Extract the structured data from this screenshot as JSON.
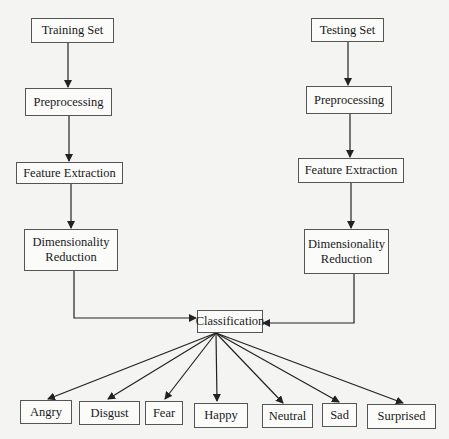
{
  "diagram": {
    "left_branch": {
      "training_set": "Training Set",
      "preprocessing": "Preprocessing",
      "feature_extraction": "Feature Extraction",
      "dimensionality_reduction_line1": "Dimensionality",
      "dimensionality_reduction_line2": "Reduction"
    },
    "right_branch": {
      "testing_set": "Testing Set",
      "preprocessing": "Preprocessing",
      "feature_extraction": "Feature Extraction",
      "dimensionality_reduction_line1": "Dimensionality",
      "dimensionality_reduction_line2": "Reduction"
    },
    "classification": "Classification",
    "emotions": [
      "Angry",
      "Disgust",
      "Fear",
      "Happy",
      "Neutral",
      "Sad",
      "Surprised"
    ],
    "colors": {
      "line": "#222222",
      "border": "#555555",
      "background": "#f4f4f2"
    }
  }
}
